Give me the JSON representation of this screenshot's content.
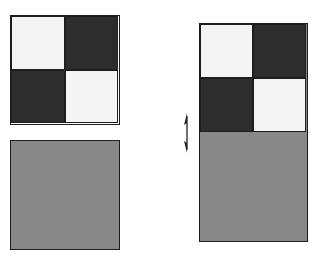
{
  "diagram": {
    "colors": {
      "light": "#f4f4f4",
      "dark": "#2d2d2d",
      "gray": "#888888",
      "border": "#1e1e1e"
    },
    "left": {
      "checker_square": {
        "cells": [
          "light",
          "dark",
          "dark",
          "light"
        ]
      },
      "gray_square": {
        "fill": "gray"
      }
    },
    "right": {
      "stacked_rect": {
        "top_cells": [
          "light",
          "dark",
          "dark",
          "light"
        ],
        "bottom_fill": "gray"
      },
      "marker": "vertical-double-arrow-icon"
    }
  }
}
